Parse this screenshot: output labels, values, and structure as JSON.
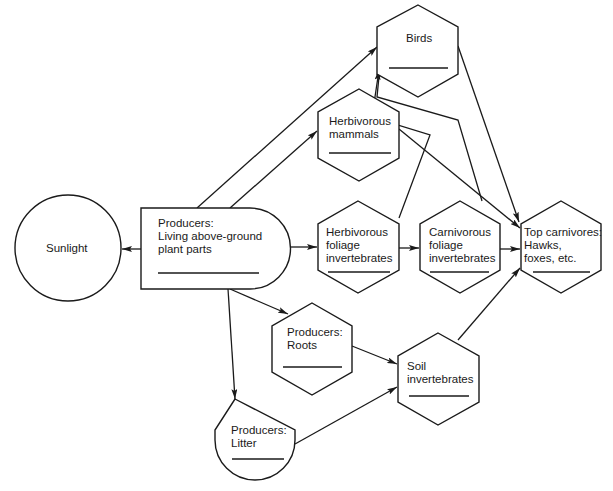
{
  "diagram": {
    "type": "energy-flow food web",
    "nodes": {
      "sunlight": {
        "label": "Sunlight",
        "shape": "circle"
      },
      "producers_above": {
        "label": "Producers:\nLiving above-ground\nplant parts",
        "shape": "rounded-rect"
      },
      "birds": {
        "label": "Birds",
        "shape": "hexagon"
      },
      "herb_mammals": {
        "label": "Herbivorous\nmammals",
        "shape": "hexagon"
      },
      "herb_foliage_inv": {
        "label": "Herbivorous\nfoliage\ninvertebrates",
        "shape": "hexagon"
      },
      "carn_foliage_inv": {
        "label": "Carnivorous\nfoliage\ninvertebrates",
        "shape": "hexagon"
      },
      "top_carnivores": {
        "label": "Top carnivores:\nHawks,\nfoxes, etc.",
        "shape": "hexagon"
      },
      "producers_roots": {
        "label": "Producers:\nRoots",
        "shape": "hexagon"
      },
      "soil_inv": {
        "label": "Soil\ninvertebrates",
        "shape": "hexagon"
      },
      "producers_litter": {
        "label": "Producers:\nLitter",
        "shape": "shield"
      }
    },
    "edges": [
      {
        "from": "producers_above",
        "to": "sunlight"
      },
      {
        "from": "producers_above",
        "to": "birds"
      },
      {
        "from": "producers_above",
        "to": "herb_mammals"
      },
      {
        "from": "producers_above",
        "to": "herb_foliage_inv"
      },
      {
        "from": "producers_above",
        "to": "producers_roots"
      },
      {
        "from": "producers_above",
        "to": "producers_litter"
      },
      {
        "from": "herb_foliage_inv",
        "to": "carn_foliage_inv"
      },
      {
        "from": "herb_foliage_inv",
        "to": "birds"
      },
      {
        "from": "carn_foliage_inv",
        "to": "birds"
      },
      {
        "from": "carn_foliage_inv",
        "to": "top_carnivores"
      },
      {
        "from": "herb_mammals",
        "to": "top_carnivores"
      },
      {
        "from": "birds",
        "to": "top_carnivores"
      },
      {
        "from": "producers_roots",
        "to": "soil_inv"
      },
      {
        "from": "producers_litter",
        "to": "soil_inv"
      },
      {
        "from": "soil_inv",
        "to": "top_carnivores"
      }
    ]
  }
}
